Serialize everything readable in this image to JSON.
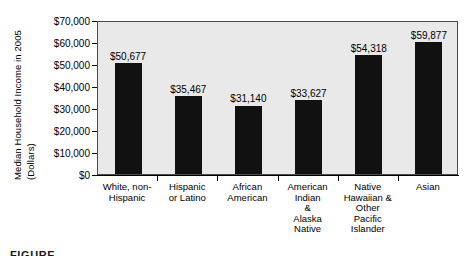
{
  "chart_data": {
    "type": "bar",
    "title": "",
    "xlabel": "",
    "ylabel": "Median Household Income in 2005 (Dollars)",
    "ylabel_lines": [
      "Median Household Income in 2005",
      "(Dollars)"
    ],
    "ylim": [
      0,
      70000
    ],
    "ytick_values": [
      0,
      10000,
      20000,
      30000,
      40000,
      50000,
      60000,
      70000
    ],
    "ytick_labels": [
      "$0",
      "$10,000",
      "$20,000",
      "$30,000",
      "$40,000",
      "$50,000",
      "$60,000",
      "$70,000"
    ],
    "grid": false,
    "legend": "none",
    "plot_background": "#e9e9e9",
    "bar_color": "#111111",
    "categories": [
      "White, non-Hispanic",
      "Hispanic or Latino",
      "African American",
      "American Indian & Alaska Native",
      "Native Hawaiian & Other Pacific Islander",
      "Asian"
    ],
    "category_label_lines": [
      [
        "White, non-",
        "Hispanic"
      ],
      [
        "Hispanic",
        "or Latino"
      ],
      [
        "African",
        "American"
      ],
      [
        "American",
        "Indian",
        "&",
        "Alaska",
        "Native"
      ],
      [
        "Native",
        "Hawaiian &",
        "Other",
        "Pacific",
        "Islander"
      ],
      [
        "Asian"
      ]
    ],
    "values": [
      50677,
      35467,
      31140,
      33627,
      54318,
      59877
    ],
    "data_labels": [
      "$50,677",
      "$35,467",
      "$31,140",
      "$33,627",
      "$54,318",
      "$59,877"
    ]
  },
  "caption": {
    "text": "FIGURE"
  }
}
